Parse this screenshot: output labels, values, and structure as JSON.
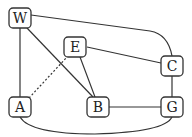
{
  "graph": {
    "nodes": [
      {
        "id": "W",
        "label": "W",
        "x": 20,
        "y": 18
      },
      {
        "id": "E",
        "label": "E",
        "x": 75,
        "y": 47
      },
      {
        "id": "C",
        "label": "C",
        "x": 172,
        "y": 66
      },
      {
        "id": "A",
        "label": "A",
        "x": 20,
        "y": 107
      },
      {
        "id": "B",
        "label": "B",
        "x": 98,
        "y": 107
      },
      {
        "id": "G",
        "label": "G",
        "x": 172,
        "y": 107
      }
    ],
    "edges": [
      {
        "from": "W",
        "to": "A",
        "style": "solid"
      },
      {
        "from": "W",
        "to": "B",
        "style": "solid"
      },
      {
        "from": "W",
        "to": "C",
        "style": "solid",
        "curved": true
      },
      {
        "from": "E",
        "to": "C",
        "style": "solid"
      },
      {
        "from": "E",
        "to": "B",
        "style": "solid"
      },
      {
        "from": "A",
        "to": "E",
        "style": "dashed"
      },
      {
        "from": "B",
        "to": "G",
        "style": "solid"
      },
      {
        "from": "C",
        "to": "G",
        "style": "solid"
      },
      {
        "from": "A",
        "to": "G",
        "style": "solid",
        "curved": true
      }
    ]
  },
  "colors": {
    "stroke": "#333333",
    "background": "#ffffff"
  }
}
